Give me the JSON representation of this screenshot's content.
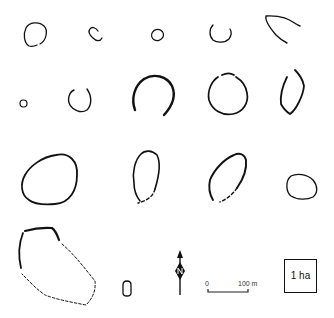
{
  "figure": {
    "line_color": "#111111",
    "background": "#ffffff"
  },
  "enclosures": [
    {
      "id": 1,
      "row": 1,
      "shape": "near-circle, small gap",
      "style": "solid"
    },
    {
      "id": 2,
      "row": 1,
      "shape": "small rounded C-shape",
      "style": "solid"
    },
    {
      "id": 3,
      "row": 1,
      "shape": "small oval",
      "style": "solid"
    },
    {
      "id": 4,
      "row": 1,
      "shape": "open-top U arc",
      "style": "solid"
    },
    {
      "id": 5,
      "row": 1,
      "shape": "partial arc (top-left segment)",
      "style": "solid"
    },
    {
      "id": 6,
      "row": 2,
      "shape": "tiny circle",
      "style": "solid"
    },
    {
      "id": 7,
      "row": 2,
      "shape": "circle with gap at top",
      "style": "solid"
    },
    {
      "id": 8,
      "row": 2,
      "shape": "horseshoe arc open at bottom, thick",
      "style": "solid"
    },
    {
      "id": 9,
      "row": 2,
      "shape": "circle with gaps at top",
      "style": "solid"
    },
    {
      "id": 10,
      "row": 2,
      "shape": "upright rounded oblong, gap at top",
      "style": "solid"
    },
    {
      "id": 11,
      "row": 3,
      "shape": "large rounded sub-triangular",
      "style": "solid"
    },
    {
      "id": 12,
      "row": 3,
      "shape": "upright oval",
      "style": "solid with dashed bottom"
    },
    {
      "id": 13,
      "row": 3,
      "shape": "tilted oval",
      "style": "solid with dashed lower right"
    },
    {
      "id": 14,
      "row": 3,
      "shape": "small horizontal oval",
      "style": "solid"
    },
    {
      "id": 15,
      "row": 4,
      "shape": "large irregular enclosure",
      "style": "solid top-left, dashed reconstruction"
    },
    {
      "id": 16,
      "row": 4,
      "shape": "very small rounded rectangle",
      "style": "solid"
    }
  ],
  "legend": {
    "north_arrow": {
      "icon": "north-arrow-icon",
      "label": "N"
    },
    "scale_bar": {
      "start_label": "0",
      "end_label": "100 m"
    },
    "area_box": {
      "label": "1 ha"
    }
  }
}
